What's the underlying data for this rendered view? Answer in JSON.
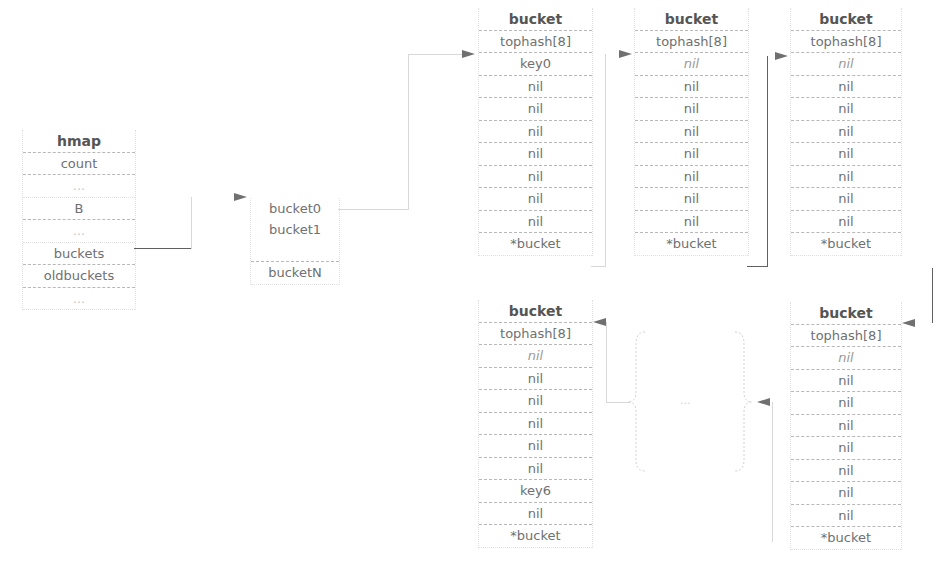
{
  "hmap": {
    "rows": [
      "hmap",
      "count",
      "...",
      "B",
      "...",
      "buckets",
      "oldbuckets",
      "..."
    ]
  },
  "bucket_array": {
    "rows": [
      "bucket0",
      "bucket1",
      "",
      "bucketN"
    ]
  },
  "buckets": [
    {
      "id": "top-1",
      "rows": [
        "bucket",
        "tophash[8]",
        "key0",
        "nil",
        "nil",
        "nil",
        "nil",
        "nil",
        "nil",
        "nil",
        "*bucket"
      ]
    },
    {
      "id": "top-2",
      "rows": [
        "bucket",
        "tophash[8]",
        "nil",
        "nil",
        "nil",
        "nil",
        "nil",
        "nil",
        "nil",
        "nil",
        "*bucket"
      ]
    },
    {
      "id": "top-3",
      "rows": [
        "bucket",
        "tophash[8]",
        "nil",
        "nil",
        "nil",
        "nil",
        "nil",
        "nil",
        "nil",
        "nil",
        "*bucket"
      ]
    },
    {
      "id": "bottom-left",
      "rows": [
        "bucket",
        "tophash[8]",
        "nil",
        "nil",
        "nil",
        "nil",
        "nil",
        "nil",
        "key6",
        "nil",
        "*bucket"
      ]
    },
    {
      "id": "bottom-right",
      "rows": [
        "bucket",
        "tophash[8]",
        "nil",
        "nil",
        "nil",
        "nil",
        "nil",
        "nil",
        "nil",
        "nil",
        "*bucket"
      ]
    }
  ],
  "ellipsis": {
    "label": "..."
  },
  "colors": {
    "line": "#606060",
    "text": "#707070",
    "divider": "#b8b8b8"
  }
}
